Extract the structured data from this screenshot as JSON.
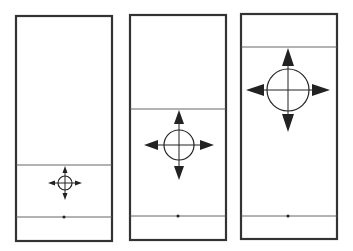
{
  "diagram": {
    "colors": {
      "background": "#ffffff",
      "frame_stroke": "#333333",
      "line_stroke": "#555555",
      "symbol": "#222222"
    },
    "panels": [
      {
        "id": "panel-1",
        "frame": {
          "x": 16,
          "y": 16,
          "w": 96,
          "h": 225
        },
        "upper_line_y": 165,
        "lower_line_y": 217,
        "dot": {
          "x": 64,
          "y": 217
        },
        "target": {
          "cx": 65,
          "cy": 183,
          "r": 7,
          "arrow_reach": 17,
          "arrow_len": 7,
          "arrow_half_width": 2.5
        }
      },
      {
        "id": "panel-2",
        "frame": {
          "x": 130,
          "y": 15,
          "w": 96,
          "h": 225
        },
        "upper_line_y": 109,
        "lower_line_y": 216,
        "dot": {
          "x": 178,
          "y": 216
        },
        "target": {
          "cx": 179,
          "cy": 145,
          "r": 15,
          "arrow_reach": 35,
          "arrow_len": 14,
          "arrow_half_width": 5
        }
      },
      {
        "id": "panel-3",
        "frame": {
          "x": 241,
          "y": 14,
          "w": 96,
          "h": 225
        },
        "upper_line_y": 47,
        "lower_line_y": 216,
        "dot": {
          "x": 288,
          "y": 216
        },
        "target": {
          "cx": 288,
          "cy": 90,
          "r": 21,
          "arrow_reach": 42,
          "arrow_len": 18,
          "arrow_half_width": 6
        }
      }
    ]
  }
}
